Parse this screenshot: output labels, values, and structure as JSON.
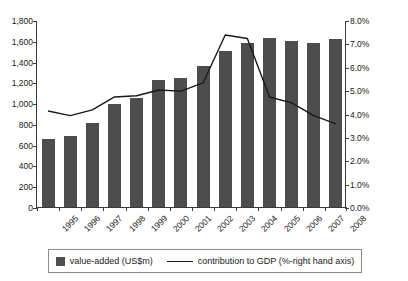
{
  "chart_data": {
    "type": "bar",
    "title": "",
    "subtitle": "",
    "xlabel": "",
    "ylabel": "",
    "categories": [
      "1995",
      "1996",
      "1997",
      "1998",
      "1999",
      "2000",
      "2001",
      "2002",
      "2003",
      "2004",
      "2005",
      "2006",
      "2007",
      "2008"
    ],
    "grid": false,
    "legend_position": "bottom",
    "axes": {
      "left": {
        "label": "",
        "ylim": [
          0,
          1800
        ],
        "ticks": [
          0,
          200,
          400,
          600,
          800,
          1000,
          1200,
          1400,
          1600,
          1800
        ],
        "tick_labels": [
          "0",
          "200",
          "400",
          "600",
          "800",
          "1,000",
          "1,200",
          "1,400",
          "1,600",
          "1,800"
        ],
        "unit": "US$m"
      },
      "right": {
        "label": "",
        "ylim": [
          0,
          8
        ],
        "ticks": [
          0,
          1,
          2,
          3,
          4,
          5,
          6,
          7,
          8
        ],
        "tick_labels": [
          "0.0%",
          "1.0%",
          "2.0%",
          "3.0%",
          "4.0%",
          "5.0%",
          "6.0%",
          "7.0%",
          "8.0%"
        ],
        "unit": "%"
      }
    },
    "series": [
      {
        "name": "value-added (US$m)",
        "type": "bar",
        "axis": "left",
        "color": "#4d4d4d",
        "values": [
          650,
          685,
          810,
          995,
          1050,
          1220,
          1245,
          1360,
          1500,
          1580,
          1625,
          1600,
          1575,
          1620
        ]
      },
      {
        "name": "contribution to GDP (%-right hand axis)",
        "type": "line",
        "axis": "right",
        "color": "#1a1a1a",
        "values": [
          4.15,
          3.95,
          4.2,
          4.75,
          4.8,
          5.05,
          5.0,
          5.35,
          7.4,
          7.25,
          4.75,
          4.5,
          3.95,
          3.6
        ]
      }
    ],
    "legend": [
      {
        "label": "value-added (US$m)",
        "marker": "square",
        "color": "#4d4d4d"
      },
      {
        "label": "contribution to GDP (%-right hand axis)",
        "marker": "line",
        "color": "#1a1a1a"
      }
    ]
  },
  "colors": {
    "bar": "#4d4d4d",
    "line": "#1a1a1a",
    "axis": "#3a3a3a",
    "legend_border": "#8a8a8a",
    "background": "#ffffff"
  }
}
